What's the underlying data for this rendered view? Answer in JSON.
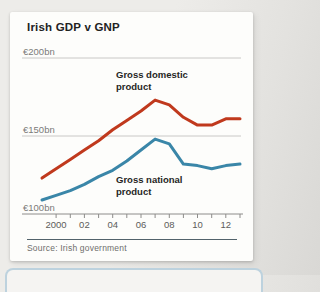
{
  "header": {
    "title": "Irish GDP v GNP"
  },
  "footer": {
    "source": "Source: Irish government"
  },
  "colors": {
    "gdp_line": "#c0391d",
    "gnp_line": "#3a86a8",
    "grid": "#c9c8c6",
    "axis": "#8d8c8a",
    "ytick_label": "#7b7b79",
    "xtick_label": "#5c5c5a",
    "source_rule": "#52626b",
    "card_bg": "#fdfdfb",
    "page_bg": "#e9e8e5"
  },
  "chart_data": {
    "type": "line",
    "title": "Irish GDP v GNP",
    "unit": "EUR bn",
    "x": [
      1999,
      2000,
      2001,
      2002,
      2003,
      2004,
      2005,
      2006,
      2007,
      2008,
      2009,
      2010,
      2011,
      2012,
      2013
    ],
    "series": [
      {
        "name": "Gross domestic product",
        "color": "#c0391d",
        "values": [
          123,
          129,
          135,
          141,
          147,
          154,
          160,
          166,
          173,
          170,
          162,
          157,
          157,
          161,
          161
        ]
      },
      {
        "name": "Gross national product",
        "color": "#3a86a8",
        "values": [
          109,
          112,
          115,
          119,
          124,
          128,
          134,
          141,
          148,
          145,
          132,
          131,
          129,
          131,
          132
        ]
      }
    ],
    "ylim": [
      100,
      210
    ],
    "yticks": [
      {
        "value": 200,
        "label": "€200bn"
      },
      {
        "value": 150,
        "label": "€150bn"
      },
      {
        "value": 100,
        "label": "€100bn"
      }
    ],
    "xticks": [
      {
        "year": 2000,
        "label": "2000"
      },
      {
        "year": 2002,
        "label": "02"
      },
      {
        "year": 2004,
        "label": "04"
      },
      {
        "year": 2006,
        "label": "06"
      },
      {
        "year": 2008,
        "label": "08"
      },
      {
        "year": 2010,
        "label": "10"
      },
      {
        "year": 2012,
        "label": "12"
      }
    ],
    "minor_ticks": "every year 2000-2013",
    "grid": "horizontal gridlines at 150bn and 200bn, baseline axis at 100bn",
    "legend": "inline annotations next to lines",
    "annotations": [
      {
        "text": "Gross domestic\nproduct",
        "series": "Gross domestic product"
      },
      {
        "text": "Gross national\nproduct",
        "series": "Gross national product"
      }
    ]
  }
}
